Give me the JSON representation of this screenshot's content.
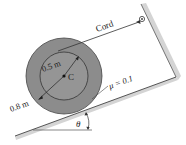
{
  "diagram": {
    "type": "mechanics-free-body",
    "labels": {
      "cord": "Cord",
      "inner_radius": "0.5 m",
      "outer_radius": "0.8 m",
      "center": "C",
      "friction": "μ = 0.1",
      "angle": "θ"
    },
    "colors": {
      "disk_fill": "#8a8a8a",
      "inner_fill": "#999999",
      "line": "#333333",
      "surface_shade": "#cfcfcf"
    }
  }
}
